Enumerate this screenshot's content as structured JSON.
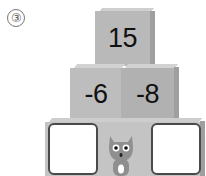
{
  "problem_label": "③",
  "pyramid": {
    "top": {
      "value": "15"
    },
    "middle": [
      {
        "value": "-6"
      },
      {
        "value": "-8"
      }
    ],
    "bottom": [
      {
        "value": ""
      },
      {
        "value": "cat"
      },
      {
        "value": ""
      }
    ]
  },
  "colors": {
    "cube_face": "#b9b9b9",
    "cube_top": "#d2d2d2",
    "cube_side": "#9f9f9f",
    "box_border": "#4a4a4a"
  }
}
